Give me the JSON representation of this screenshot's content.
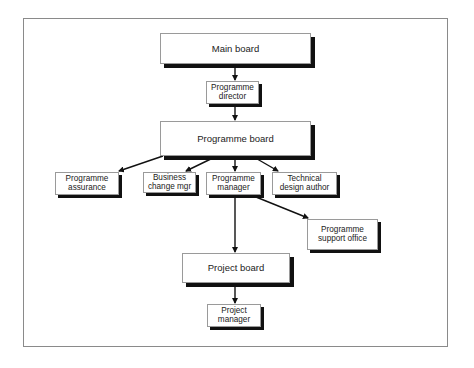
{
  "diagram": {
    "type": "organisation-chart",
    "nodes": [
      {
        "id": "main_board",
        "label": "Main board"
      },
      {
        "id": "programme_director",
        "label": "Programme\ndirector"
      },
      {
        "id": "programme_board",
        "label": "Programme board"
      },
      {
        "id": "programme_assurance",
        "label": "Programme\nassurance"
      },
      {
        "id": "business_change_mgr",
        "label": "Business\nchange mgr"
      },
      {
        "id": "programme_manager",
        "label": "Programme\nmanager"
      },
      {
        "id": "technical_design_author",
        "label": "Technical\ndesign author"
      },
      {
        "id": "programme_support_office",
        "label": "Programme\nsupport office"
      },
      {
        "id": "project_board",
        "label": "Project board"
      },
      {
        "id": "project_manager",
        "label": "Project\nmanager"
      }
    ],
    "edges": [
      {
        "from": "main_board",
        "to": "programme_director"
      },
      {
        "from": "programme_director",
        "to": "programme_board"
      },
      {
        "from": "programme_board",
        "to": "programme_assurance"
      },
      {
        "from": "programme_board",
        "to": "business_change_mgr"
      },
      {
        "from": "programme_board",
        "to": "programme_manager"
      },
      {
        "from": "programme_board",
        "to": "technical_design_author"
      },
      {
        "from": "programme_manager",
        "to": "programme_support_office"
      },
      {
        "from": "programme_manager",
        "to": "project_board"
      },
      {
        "from": "project_board",
        "to": "project_manager"
      }
    ]
  },
  "colors": {
    "box_border": "#9a9a9a",
    "shadow": "#111111",
    "arrow": "#111111",
    "frame": "#8a8a8a"
  }
}
